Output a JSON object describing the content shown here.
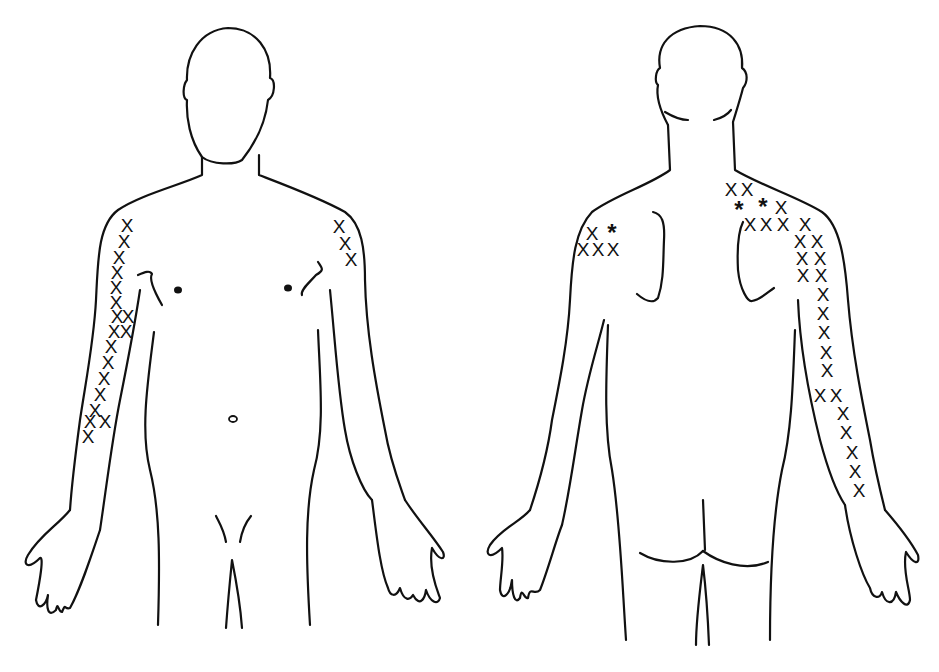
{
  "diagram": {
    "type": "body-pain-chart",
    "figures": [
      {
        "id": "front",
        "view": "anterior"
      },
      {
        "id": "back",
        "view": "posterior"
      }
    ],
    "legend_symbols": {
      "x": "X",
      "star": "*"
    },
    "colors": {
      "line": "#111111",
      "background": "#ffffff"
    },
    "markers": {
      "front_right_arm": [
        {
          "s": "X",
          "x": 127,
          "y": 225
        },
        {
          "s": "X",
          "x": 124,
          "y": 241
        },
        {
          "s": "X",
          "x": 119,
          "y": 257
        },
        {
          "s": "X",
          "x": 117,
          "y": 272
        },
        {
          "s": "X",
          "x": 116,
          "y": 287
        },
        {
          "s": "X",
          "x": 116,
          "y": 302
        },
        {
          "s": "X",
          "x": 117,
          "y": 316
        },
        {
          "s": "X",
          "x": 128,
          "y": 316
        },
        {
          "s": "X",
          "x": 114,
          "y": 331
        },
        {
          "s": "X",
          "x": 126,
          "y": 331
        },
        {
          "s": "X",
          "x": 111,
          "y": 346
        },
        {
          "s": "X",
          "x": 108,
          "y": 362
        },
        {
          "s": "X",
          "x": 104,
          "y": 378
        },
        {
          "s": "X",
          "x": 100,
          "y": 394
        },
        {
          "s": "X",
          "x": 95,
          "y": 410
        },
        {
          "s": "X",
          "x": 90,
          "y": 421
        },
        {
          "s": "X",
          "x": 105,
          "y": 421
        },
        {
          "s": "X",
          "x": 88,
          "y": 436
        }
      ],
      "front_left_shoulder": [
        {
          "s": "X",
          "x": 339,
          "y": 226
        },
        {
          "s": "X",
          "x": 345,
          "y": 243
        },
        {
          "s": "X",
          "x": 351,
          "y": 259
        }
      ],
      "back_left_shoulder": [
        {
          "s": "X",
          "x": 592,
          "y": 233
        },
        {
          "s": "*",
          "x": 612,
          "y": 233
        },
        {
          "s": "X",
          "x": 583,
          "y": 249
        },
        {
          "s": "X",
          "x": 598,
          "y": 249
        },
        {
          "s": "X",
          "x": 613,
          "y": 249
        }
      ],
      "back_right_shoulder_arm": [
        {
          "s": "X",
          "x": 731,
          "y": 189
        },
        {
          "s": "X",
          "x": 747,
          "y": 189
        },
        {
          "s": "*",
          "x": 739,
          "y": 210
        },
        {
          "s": "*",
          "x": 763,
          "y": 207
        },
        {
          "s": "X",
          "x": 781,
          "y": 207
        },
        {
          "s": "X",
          "x": 750,
          "y": 224
        },
        {
          "s": "X",
          "x": 766,
          "y": 224
        },
        {
          "s": "X",
          "x": 783,
          "y": 224
        },
        {
          "s": "X",
          "x": 805,
          "y": 224
        },
        {
          "s": "X",
          "x": 800,
          "y": 241
        },
        {
          "s": "X",
          "x": 817,
          "y": 241
        },
        {
          "s": "X",
          "x": 802,
          "y": 258
        },
        {
          "s": "X",
          "x": 820,
          "y": 258
        },
        {
          "s": "X",
          "x": 803,
          "y": 275
        },
        {
          "s": "X",
          "x": 821,
          "y": 275
        },
        {
          "s": "X",
          "x": 823,
          "y": 294
        },
        {
          "s": "X",
          "x": 823,
          "y": 313
        },
        {
          "s": "X",
          "x": 824,
          "y": 332
        },
        {
          "s": "X",
          "x": 826,
          "y": 352
        },
        {
          "s": "X",
          "x": 827,
          "y": 370
        },
        {
          "s": "X",
          "x": 820,
          "y": 395
        },
        {
          "s": "X",
          "x": 836,
          "y": 395
        },
        {
          "s": "X",
          "x": 843,
          "y": 413
        },
        {
          "s": "X",
          "x": 846,
          "y": 432
        },
        {
          "s": "X",
          "x": 852,
          "y": 452
        },
        {
          "s": "X",
          "x": 855,
          "y": 471
        },
        {
          "s": "X",
          "x": 859,
          "y": 490
        }
      ]
    }
  }
}
